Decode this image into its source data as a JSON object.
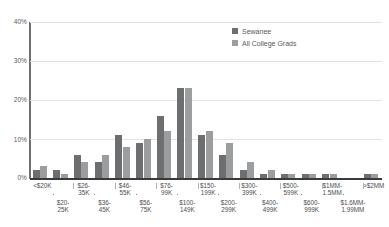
{
  "chart_data": {
    "type": "bar",
    "title": "",
    "xlabel": "",
    "ylabel": "",
    "ylim": [
      0,
      40
    ],
    "yticks": [
      "0%",
      "10%",
      "20%",
      "30%",
      "40%"
    ],
    "ytick_values": [
      0,
      10,
      20,
      30,
      40
    ],
    "grid": true,
    "legend_position": "top-right",
    "categories": [
      "<$20K",
      "$20-25K",
      "$26-35K",
      "$36-45K",
      "$46-55K",
      "$56-75K",
      "$76-99K",
      "$100-149K",
      "$150-199K",
      "$200-299K",
      "$300-399K",
      "$400-499K",
      "$500-599K",
      "$600-999K",
      "$1MM-1.5MM",
      "$1.6MM-1.99MM",
      ">$2MM"
    ],
    "series": [
      {
        "name": "Sewanee",
        "color": "#6d6e70",
        "values": [
          2,
          2,
          6,
          4,
          11,
          9,
          16,
          23,
          11,
          6,
          2,
          1,
          1,
          1,
          1,
          0,
          1
        ]
      },
      {
        "name": "All College Grads",
        "color": "#9c9d9f",
        "values": [
          3,
          1,
          4,
          6,
          8,
          10,
          12,
          23,
          12,
          9,
          4,
          2,
          1,
          1,
          1,
          0,
          1
        ]
      }
    ]
  },
  "legend": {
    "items": [
      {
        "label": "Sewanee",
        "color": "#6d6e70"
      },
      {
        "label": "All College Grads",
        "color": "#9c9d9f"
      }
    ]
  },
  "x_axis": {
    "top_row": [
      "<$20K",
      "$26-\n35K",
      "$46-\n55K",
      "$76-\n99K",
      "$150-\n199K",
      "$300-\n399K",
      "$500-\n599K",
      "$1MM-\n1.5MM",
      ">$2MM"
    ],
    "bottom_row": [
      "$20-\n25K",
      "$36-\n45K",
      "$56-\n75K",
      "$100-\n149K",
      "$200-\n299K",
      "$400-\n499K",
      "$600-\n999K",
      "$1.6MM-\n1.99MM"
    ]
  }
}
